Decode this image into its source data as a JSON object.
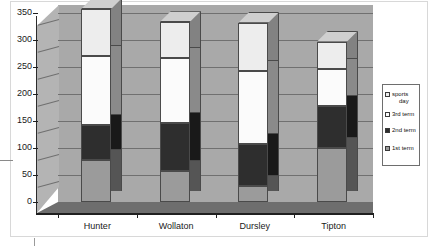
{
  "chart_data": {
    "type": "bar",
    "subtype": "stacked-column-3d",
    "title": "",
    "xlabel": "",
    "ylabel": "",
    "categories": [
      "Hunter",
      "Wollaton",
      "Dursley",
      "Tipton"
    ],
    "series": [
      {
        "name": "1st term",
        "values": [
          78,
          57,
          30,
          100
        ],
        "color": "#9b9b9b"
      },
      {
        "name": "2nd term",
        "values": [
          65,
          89,
          78,
          78
        ],
        "color": "#2e2e2e"
      },
      {
        "name": "3rd term",
        "values": [
          127,
          120,
          135,
          68
        ],
        "color": "#fbfbfb"
      },
      {
        "name": "sports day",
        "values": [
          87,
          67,
          89,
          51
        ],
        "color": "#ededed"
      }
    ],
    "cumulative_totals": [
      357,
      333,
      332,
      297
    ],
    "ylim": [
      0,
      350
    ],
    "yticks": [
      0,
      50,
      100,
      150,
      200,
      250,
      300,
      350
    ],
    "ytick_labels": [
      "0",
      "50",
      "100",
      "150",
      "200",
      "250",
      "300",
      "350"
    ],
    "grid": true,
    "grid_axis": "y",
    "legend_position": "right",
    "legend_order": [
      "sports day",
      "3rd term",
      "2nd term",
      "1st term"
    ]
  },
  "legend": {
    "entries": [
      {
        "label_line1": "sports",
        "label_line2": "day",
        "swatch": "#ededed"
      },
      {
        "label_line1": "3rd term",
        "label_line2": "",
        "swatch": "#fbfbfb"
      },
      {
        "label_line1": "2nd term",
        "label_line2": "",
        "swatch": "#2e2e2e"
      },
      {
        "label_line1": "1st term",
        "label_line2": "",
        "swatch": "#9b9b9b"
      }
    ]
  },
  "palette": {
    "plot_back_wall": "#a9a9a9",
    "plot_side_wall": "#b4b4b4",
    "plot_floor": "#6e6e6e",
    "gridline": "#707070",
    "axis": "#1f1f1f",
    "bar_outline": "#4a4a4a",
    "bar_top_face": "#cfcfcf",
    "frame": "#d8d8d8",
    "background": "#ffffff",
    "text": "#1a1a1a"
  }
}
